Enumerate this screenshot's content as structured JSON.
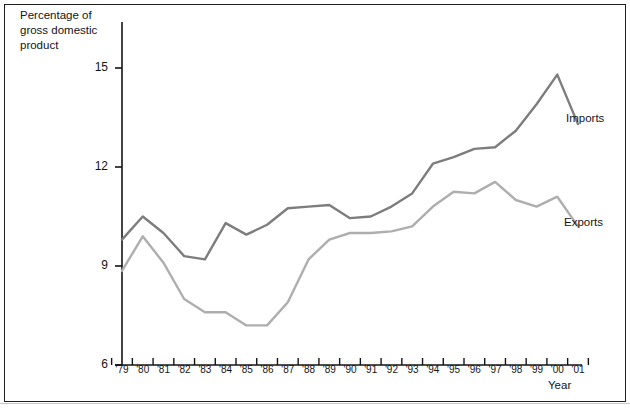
{
  "figure": {
    "y_axis_title": "Percentage of\ngross domestic\nproduct",
    "x_axis_title": "Year",
    "y_tick_labels": [
      "15",
      "12",
      "9",
      "6"
    ],
    "series_labels": {
      "imports": "Imports",
      "exports": "Exports"
    },
    "colors": {
      "imports": "#7d7d7d",
      "exports": "#aeaeae",
      "frame": "#221f1f",
      "axis": "#141414"
    }
  },
  "chart_data": {
    "type": "line",
    "title": "",
    "xlabel": "Year",
    "ylabel": "Percentage of gross domestic product",
    "xlim": [
      1979,
      2001
    ],
    "ylim": [
      6,
      15.8
    ],
    "yticks": [
      6,
      9,
      12,
      15
    ],
    "grid": false,
    "legend": "inline-right-of-lines",
    "categories": [
      "'79",
      "'80",
      "'81",
      "'82",
      "'83",
      "'84",
      "'85",
      "'86",
      "'87",
      "'88",
      "'89",
      "'90",
      "'91",
      "'92",
      "'93",
      "'94",
      "'95",
      "'96",
      "'97",
      "'98",
      "'99",
      "'00",
      "'01"
    ],
    "x": [
      1979,
      1980,
      1981,
      1982,
      1983,
      1984,
      1985,
      1986,
      1987,
      1988,
      1989,
      1990,
      1991,
      1992,
      1993,
      1994,
      1995,
      1996,
      1997,
      1998,
      1999,
      2000,
      2001
    ],
    "series": [
      {
        "name": "Imports",
        "color": "#7d7d7d",
        "values": [
          9.8,
          10.5,
          10.0,
          9.3,
          9.2,
          10.3,
          9.95,
          10.25,
          10.75,
          10.8,
          10.85,
          10.45,
          10.5,
          10.8,
          11.2,
          12.1,
          12.3,
          12.55,
          12.6,
          13.1,
          13.9,
          14.8,
          13.3
        ]
      },
      {
        "name": "Exports",
        "color": "#aeaeae",
        "values": [
          8.85,
          9.9,
          9.1,
          8.0,
          7.6,
          7.6,
          7.2,
          7.2,
          7.9,
          9.2,
          9.8,
          10.0,
          10.0,
          10.05,
          10.2,
          10.8,
          11.25,
          11.2,
          11.55,
          11.0,
          10.8,
          11.1,
          10.2
        ]
      }
    ]
  }
}
